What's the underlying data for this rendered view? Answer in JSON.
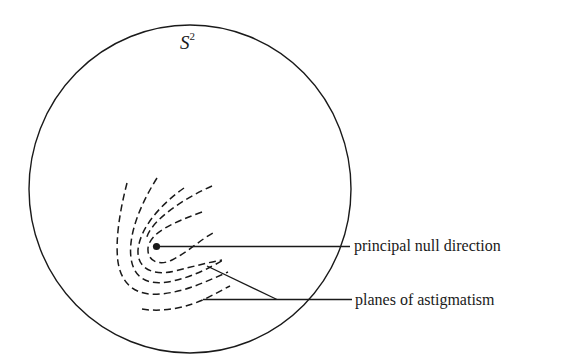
{
  "figure": {
    "sphere_label": "S",
    "sphere_label_exponent": "2",
    "colors": {
      "ink": "#1a1a1a",
      "background": "#ffffff"
    },
    "labels": {
      "principal_null_direction": "principal null direction",
      "planes_of_astigmatism": "planes of astigmatism"
    },
    "geometry": {
      "sphere": {
        "cx": 190,
        "cy": 189,
        "rx": 161,
        "ry": 164
      },
      "principal_point": {
        "x": 156.5,
        "y": 246.5
      }
    }
  }
}
